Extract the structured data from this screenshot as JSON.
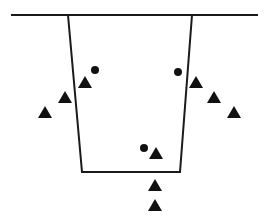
{
  "diagram": {
    "background": "#ffffff",
    "stroke_color": "#1a1a1a",
    "fill_color": "#111111",
    "surface_line": {
      "x1": 11,
      "y1": 15,
      "x2": 258,
      "y2": 15
    },
    "trench": {
      "top_left": [
        68,
        15
      ],
      "bottom_left": [
        82,
        172
      ],
      "bottom_right": [
        180,
        172
      ],
      "top_right": [
        192,
        15
      ]
    },
    "triangles": [
      {
        "x": 85,
        "y": 82
      },
      {
        "x": 65,
        "y": 97
      },
      {
        "x": 45,
        "y": 112
      },
      {
        "x": 196,
        "y": 82
      },
      {
        "x": 214,
        "y": 97
      },
      {
        "x": 234,
        "y": 112
      },
      {
        "x": 156,
        "y": 153
      },
      {
        "x": 155,
        "y": 185
      },
      {
        "x": 155,
        "y": 205
      }
    ],
    "dots": [
      {
        "x": 95,
        "y": 70
      },
      {
        "x": 178,
        "y": 72
      },
      {
        "x": 144,
        "y": 148
      }
    ]
  }
}
